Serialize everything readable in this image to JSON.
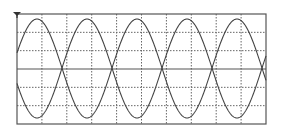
{
  "chart_data": {
    "type": "line",
    "title": "",
    "xlabel": "",
    "ylabel": "",
    "grid": true,
    "grid_style": "dotted",
    "x_divisions": 10,
    "y_divisions": 6,
    "legend": null,
    "series": [
      {
        "name": "upper-trace",
        "cycles": 5,
        "shape": "rectified-sine",
        "orientation": "rounded-peaks-up",
        "min_level": 0.0,
        "max_level": 1.0,
        "band": "upper-half"
      },
      {
        "name": "lower-trace",
        "cycles": 5,
        "shape": "rectified-sine",
        "orientation": "rounded-troughs-down",
        "min_level": -1.0,
        "max_level": 0.0,
        "band": "lower-half"
      }
    ],
    "trigger_marker": "down-triangle-top-left"
  },
  "colors": {
    "frame": "#555555",
    "grid": "#666666",
    "trace": "#444444",
    "background": "#ffffff"
  },
  "geometry": {
    "left": 17,
    "top": 14,
    "right": 266,
    "bottom": 124,
    "period_px": 50,
    "phase_px": 12,
    "upper_base": 68,
    "upper_amp": 49,
    "lower_base": 68,
    "lower_amp": 50
  }
}
